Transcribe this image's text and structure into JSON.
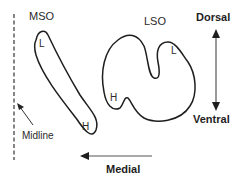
{
  "diagram": {
    "nuclei": {
      "mso": {
        "label": "MSO",
        "low_label": "L",
        "high_label": "H"
      },
      "lso": {
        "label": "LSO",
        "low_label": "L",
        "high_label": "H"
      }
    },
    "midline": {
      "label": "Midline"
    },
    "orientation": {
      "dorsal": "Dorsal",
      "ventral": "Ventral",
      "medial": "Medial"
    },
    "colors": {
      "stroke": "#1e1e1e",
      "text": "#2a2a2a",
      "arrow": "#555555"
    }
  }
}
